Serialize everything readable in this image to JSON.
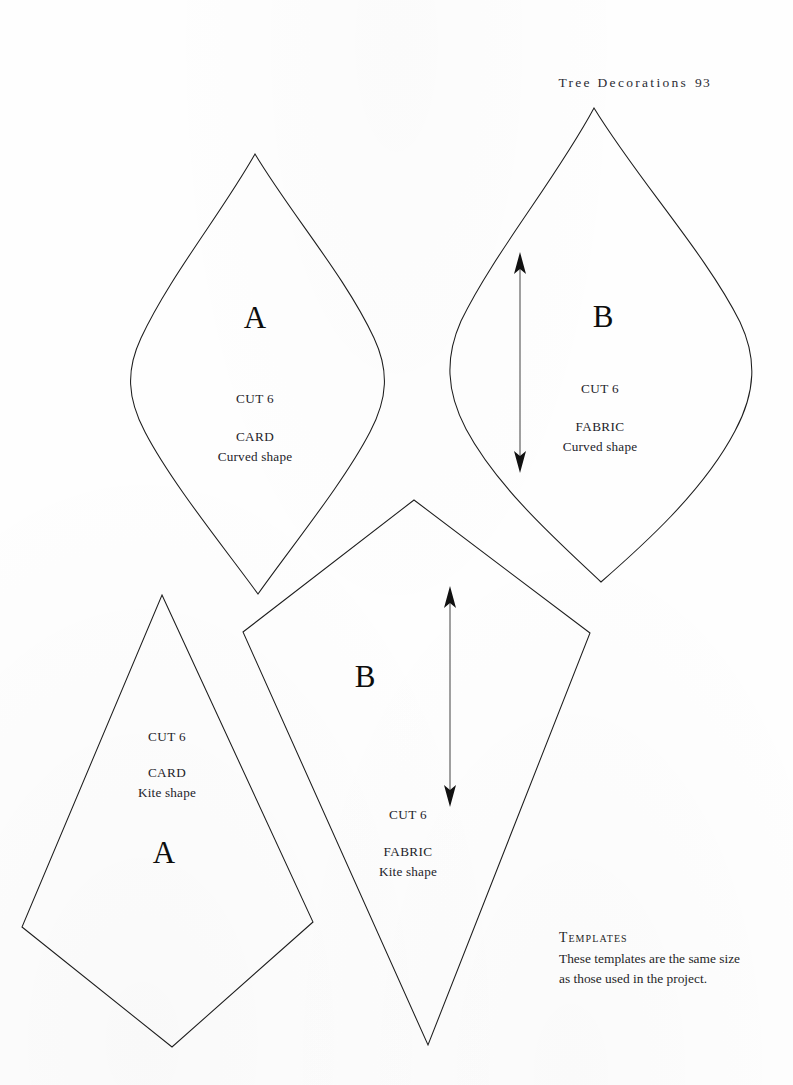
{
  "page": {
    "width": 793,
    "height": 1085,
    "background_color": "#fefefe",
    "ink_color": "#1d1d1d"
  },
  "running_head": {
    "title": "Tree Decorations",
    "folio": "93"
  },
  "templates": [
    {
      "id": "curved-a",
      "letter": "A",
      "shape_kind": "Curved shape",
      "material": "CARD",
      "cut": "CUT 6",
      "shape_label": "Curved shape",
      "has_grain_arrow": false
    },
    {
      "id": "curved-b",
      "letter": "B",
      "shape_kind": "Curved shape",
      "material": "FABRIC",
      "cut": "CUT 6",
      "shape_label": "Curved shape",
      "has_grain_arrow": true
    },
    {
      "id": "kite-a",
      "letter": "A",
      "shape_kind": "Kite shape",
      "material": "CARD",
      "cut": "CUT 6",
      "shape_label": "Kite shape",
      "has_grain_arrow": false
    },
    {
      "id": "kite-b",
      "letter": "B",
      "shape_kind": "Kite shape",
      "material": "FABRIC",
      "cut": "CUT 6",
      "shape_label": "Kite shape",
      "has_grain_arrow": true
    }
  ],
  "caption": {
    "heading": "Templates",
    "body": "These templates are the same size as those used in the project."
  }
}
